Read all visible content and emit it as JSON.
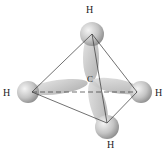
{
  "diagram": {
    "central_atom": {
      "label": "C",
      "x": 90,
      "y": 80
    },
    "hydrogens": [
      {
        "id": "top",
        "label": "H",
        "sphere": [
          92,
          34
        ],
        "label_pos": [
          86,
          9
        ]
      },
      {
        "id": "left",
        "label": "H",
        "sphere": [
          28,
          92
        ],
        "label_pos": [
          4,
          88
        ]
      },
      {
        "id": "right",
        "label": "H",
        "sphere": [
          141,
          92
        ],
        "label_pos": [
          157,
          88
        ]
      },
      {
        "id": "bottom",
        "label": "H",
        "sphere": [
          107,
          127
        ],
        "label_pos": [
          107,
          141
        ]
      }
    ],
    "colors": {
      "orbital": "#c8c8c8",
      "edge": "#333333",
      "text": "#222222"
    }
  }
}
